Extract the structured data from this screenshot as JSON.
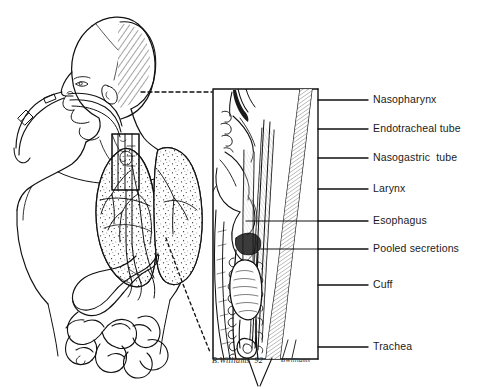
{
  "figure": {
    "background_color": "#ffffff",
    "ink_color": "#111111"
  },
  "callouts": [
    {
      "id": "nasopharynx",
      "label": "Nasopharynx",
      "y": 100
    },
    {
      "id": "endotracheal-tube",
      "label": "Endotracheal tube",
      "y": 129
    },
    {
      "id": "nasogastric-tube",
      "label": "Nasogastric  tube",
      "y": 158
    },
    {
      "id": "larynx",
      "label": "Larynx",
      "y": 189
    },
    {
      "id": "esophagus",
      "label": "Esophagus",
      "y": 221
    },
    {
      "id": "pooled-secretions",
      "label": "Pooled secretions",
      "y": 249
    },
    {
      "id": "cuff",
      "label": "Cuff",
      "y": 285
    },
    {
      "id": "trachea",
      "label": "Trachea",
      "y": 347
    }
  ],
  "signatures": [
    {
      "id": "artist-signature",
      "text": "B.Williams  92",
      "x": 212,
      "y": 363
    },
    {
      "id": "artist-mark",
      "text": "BWilliams",
      "x": 281,
      "y": 363
    }
  ],
  "body_figure": {
    "regions": [
      "head-and-neck",
      "thorax-with-lungs",
      "abdomen-with-stomach-and-intestines"
    ],
    "tubes": [
      "endotracheal-tube",
      "nasogastric-tube",
      "tube-connector"
    ]
  },
  "inset": {
    "id": "sagittal-airway-inset",
    "x": 212,
    "y": 88,
    "width": 107,
    "height": 272,
    "structures": [
      "nasopharynx",
      "soft-palate",
      "tongue",
      "epiglottis",
      "larynx",
      "esophagus",
      "trachea",
      "tracheal-rings",
      "endotracheal-tube",
      "nasogastric-tube",
      "inflated-cuff",
      "pooled-secretions",
      "vertebral-column"
    ]
  },
  "leader_rail": {
    "x": 318,
    "top": 88,
    "bottom": 360
  }
}
